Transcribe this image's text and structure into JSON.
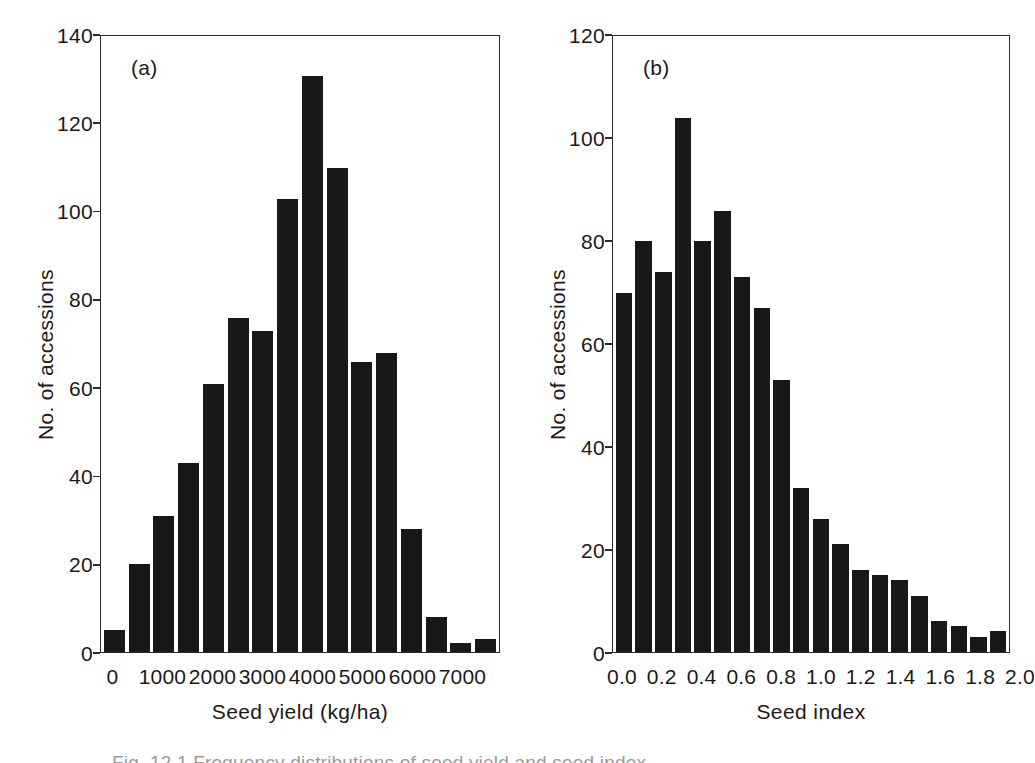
{
  "figure": {
    "caption": "Fig. 12.1  Frequency distributions of seed yield and seed index",
    "background_color": "#ffffff",
    "ink_color": "#181818",
    "axis_color": "#2b2b2b"
  },
  "panels": [
    {
      "letter": "(a)",
      "xlabel": "Seed yield (kg/ha)",
      "ylabel": "No. of accessions"
    },
    {
      "letter": "(b)",
      "xlabel": "Seed index",
      "ylabel": "No. of accessions"
    }
  ],
  "chart_data": [
    {
      "type": "bar",
      "title": "(a)",
      "xlabel": "Seed yield (kg/ha)",
      "ylabel": "No. of accessions",
      "xlim": [
        -250,
        7750
      ],
      "ylim": [
        0,
        140
      ],
      "bin_width": 500,
      "grid": false,
      "legend": false,
      "yticks": [
        0,
        20,
        40,
        60,
        80,
        100,
        120,
        140
      ],
      "ytick_labels": [
        "0",
        "20",
        "40",
        "60",
        "80",
        "100",
        "120",
        "140"
      ],
      "xticks": [
        0,
        1000,
        2000,
        3000,
        4000,
        5000,
        6000,
        7000
      ],
      "xtick_labels": [
        "0",
        "1000",
        "2000",
        "3000",
        "4000",
        "5000",
        "6000",
        "7000"
      ],
      "categories": [
        "0",
        "500",
        "1000",
        "1500",
        "2000",
        "2500",
        "3000",
        "3500",
        "4000",
        "4500",
        "5000",
        "5500",
        "6000",
        "6500",
        "7000",
        "7500"
      ],
      "values": [
        5,
        20,
        31,
        43,
        61,
        76,
        73,
        103,
        131,
        110,
        66,
        68,
        28,
        8,
        2,
        3
      ]
    },
    {
      "type": "bar",
      "title": "(b)",
      "xlabel": "Seed index",
      "ylabel": "No. of accessions",
      "xlim": [
        -0.05,
        2.05
      ],
      "ylim": [
        0,
        120
      ],
      "bin_width": 0.1,
      "grid": false,
      "legend": false,
      "yticks": [
        0,
        20,
        40,
        60,
        80,
        100,
        120
      ],
      "ytick_labels": [
        "0",
        "20",
        "40",
        "60",
        "80",
        "100",
        "120"
      ],
      "xticks": [
        0.0,
        0.2,
        0.4,
        0.6,
        0.8,
        1.0,
        1.2,
        1.4,
        1.6,
        1.8,
        2.0
      ],
      "xtick_labels": [
        "0.0",
        "0.2",
        "0.4",
        "0.6",
        "0.8",
        "1.0",
        "1.2",
        "1.4",
        "1.6",
        "1.8",
        "2.0"
      ],
      "categories": [
        "0.0",
        "0.1",
        "0.2",
        "0.3",
        "0.4",
        "0.5",
        "0.6",
        "0.7",
        "0.8",
        "0.9",
        "1.0",
        "1.1",
        "1.2",
        "1.3",
        "1.4",
        "1.5",
        "1.6",
        "1.7",
        "1.8",
        "1.9"
      ],
      "values": [
        70,
        80,
        74,
        104,
        80,
        86,
        73,
        67,
        53,
        32,
        26,
        21,
        16,
        15,
        14,
        11,
        6,
        5,
        3,
        4
      ]
    }
  ]
}
